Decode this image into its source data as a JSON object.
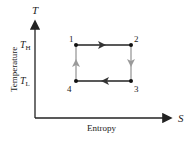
{
  "diagram": {
    "type": "T-S diagram (Carnot cycle)",
    "axes": {
      "y_symbol": "T",
      "y_label": "Temperature",
      "x_symbol": "S",
      "x_label": "Entropy",
      "y_ticks": [
        {
          "label_main": "T",
          "label_sub": "H"
        },
        {
          "label_main": "T",
          "label_sub": "L"
        }
      ]
    },
    "points": [
      {
        "id": "1",
        "label": "1"
      },
      {
        "id": "2",
        "label": "2"
      },
      {
        "id": "3",
        "label": "3"
      },
      {
        "id": "4",
        "label": "4"
      }
    ],
    "colors": {
      "line": "#222222",
      "vertical_arrow": "#9a9a9a",
      "point": "#111111"
    }
  }
}
